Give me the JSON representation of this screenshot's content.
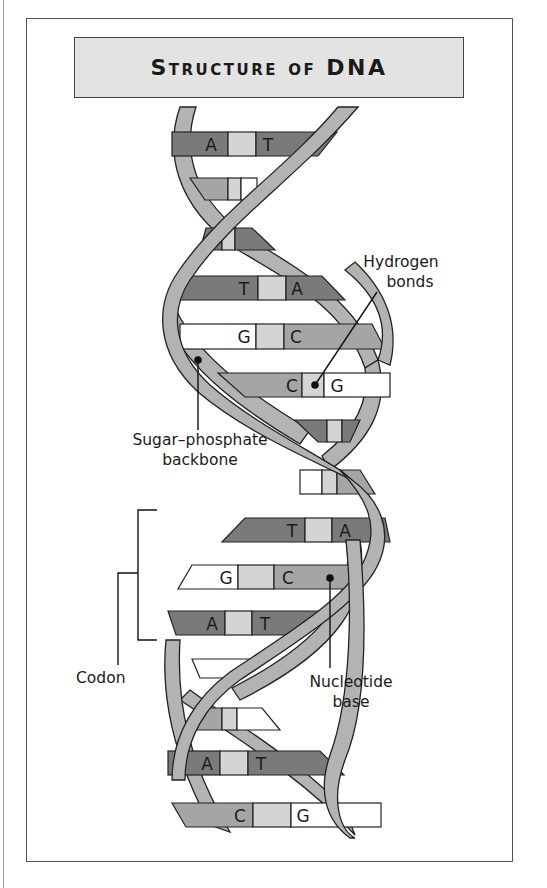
{
  "title": "Structure of DNA",
  "labels": {
    "hydrogen_bonds": "Hydrogen bonds",
    "hydrogen_line1": "Hydrogen",
    "hydrogen_line2": "bonds",
    "backbone_line1": "Sugar–phosphate",
    "backbone_line2": "backbone",
    "codon": "Codon",
    "nucleotide_line1": "Nucleotide",
    "nucleotide_line2": "base"
  },
  "base_pairs": [
    {
      "left": "A",
      "right": "T",
      "y": 144
    },
    {
      "left": "",
      "right": "",
      "y": 187
    },
    {
      "left": "",
      "right": "",
      "y": 240
    },
    {
      "left": "T",
      "right": "A",
      "y": 288
    },
    {
      "left": "G",
      "right": "C",
      "y": 337
    },
    {
      "left": "C",
      "right": "G",
      "y": 385
    },
    {
      "left": "",
      "right": "",
      "y": 431
    },
    {
      "left": "",
      "right": "",
      "y": 484
    },
    {
      "left": "T",
      "right": "A",
      "y": 531
    },
    {
      "left": "G",
      "right": "C",
      "y": 577
    },
    {
      "left": "A",
      "right": "T",
      "y": 623
    },
    {
      "left": "",
      "right": "",
      "y": 669
    },
    {
      "left": "",
      "right": "",
      "y": 718
    },
    {
      "left": "A",
      "right": "T",
      "y": 763
    },
    {
      "left": "C",
      "right": "G",
      "y": 815
    }
  ],
  "colors": {
    "dark_base": "#7a7a7a",
    "mid_base": "#a5a5a5",
    "light_bond": "#d4d4d4",
    "white_base": "#ffffff",
    "strand": "#b3b3b3",
    "title_bg": "#e3e3e3"
  }
}
